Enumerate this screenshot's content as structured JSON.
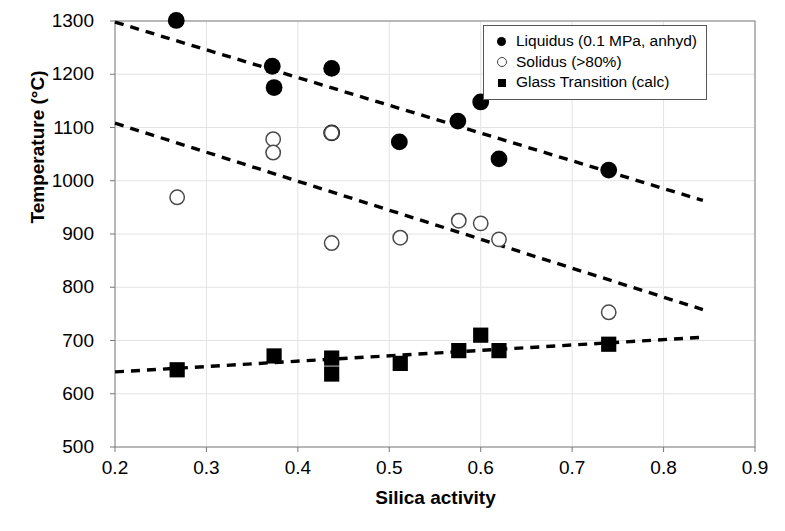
{
  "chart_data": {
    "type": "scatter",
    "title": "",
    "xlabel": "Silica activity",
    "ylabel": "Temperature (°C)",
    "xlim": [
      0.2,
      0.9
    ],
    "ylim": [
      500,
      1300
    ],
    "xticks": [
      "0.2",
      "0.3",
      "0.4",
      "0.5",
      "0.6",
      "0.7",
      "0.8",
      "0.9"
    ],
    "yticks": [
      "500",
      "600",
      "700",
      "800",
      "900",
      "1000",
      "1100",
      "1200",
      "1300"
    ],
    "grid": true,
    "legend_position": "top-right",
    "series": [
      {
        "name": "Liquidus (0.1 MPa, anhyd)",
        "marker": "filled-circle",
        "color": "#000000",
        "points": [
          {
            "x": 0.267,
            "y": 1301
          },
          {
            "x": 0.372,
            "y": 1215
          },
          {
            "x": 0.374,
            "y": 1175
          },
          {
            "x": 0.437,
            "y": 1211
          },
          {
            "x": 0.437,
            "y": 1090
          },
          {
            "x": 0.511,
            "y": 1073
          },
          {
            "x": 0.575,
            "y": 1112
          },
          {
            "x": 0.6,
            "y": 1148
          },
          {
            "x": 0.62,
            "y": 1041
          },
          {
            "x": 0.74,
            "y": 1020
          }
        ]
      },
      {
        "name": "Solidus (>80%)",
        "marker": "open-circle",
        "color": "#000000",
        "points": [
          {
            "x": 0.268,
            "y": 969
          },
          {
            "x": 0.373,
            "y": 1078
          },
          {
            "x": 0.373,
            "y": 1053
          },
          {
            "x": 0.437,
            "y": 1090
          },
          {
            "x": 0.437,
            "y": 883
          },
          {
            "x": 0.512,
            "y": 893
          },
          {
            "x": 0.576,
            "y": 925
          },
          {
            "x": 0.6,
            "y": 920
          },
          {
            "x": 0.62,
            "y": 890
          },
          {
            "x": 0.74,
            "y": 753
          }
        ]
      },
      {
        "name": "Glass Transition (calc)",
        "marker": "filled-square",
        "color": "#000000",
        "points": [
          {
            "x": 0.268,
            "y": 645
          },
          {
            "x": 0.374,
            "y": 671
          },
          {
            "x": 0.437,
            "y": 667
          },
          {
            "x": 0.437,
            "y": 637
          },
          {
            "x": 0.512,
            "y": 657
          },
          {
            "x": 0.576,
            "y": 681
          },
          {
            "x": 0.6,
            "y": 710
          },
          {
            "x": 0.62,
            "y": 681
          },
          {
            "x": 0.74,
            "y": 693
          }
        ]
      }
    ],
    "trendlines": [
      {
        "name": "liquidus-trend",
        "style": "dashed",
        "x1": 0.2,
        "y1": 1298,
        "x2": 0.843,
        "y2": 963
      },
      {
        "name": "solidus-trend",
        "style": "dashed",
        "x1": 0.2,
        "y1": 1108,
        "x2": 0.843,
        "y2": 758
      },
      {
        "name": "glass-transition-trend",
        "style": "dashed",
        "x1": 0.2,
        "y1": 641,
        "x2": 0.843,
        "y2": 706
      }
    ]
  },
  "legend": {
    "items": [
      {
        "label": "Liquidus (0.1 MPa, anhyd)",
        "marker": "filled-circle"
      },
      {
        "label": "Solidus (>80%)",
        "marker": "open-circle"
      },
      {
        "label": "Glass Transition (calc)",
        "marker": "filled-square"
      }
    ]
  }
}
